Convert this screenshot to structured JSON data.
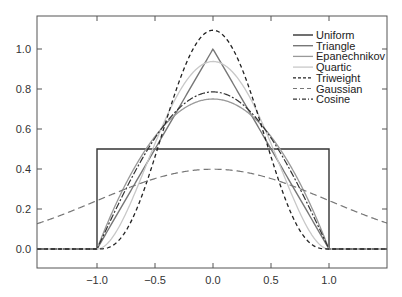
{
  "chart_data": {
    "type": "line",
    "title": "",
    "xlabel": "",
    "ylabel": "",
    "xlim": [
      -1.52,
      1.5
    ],
    "ylim": [
      -0.095,
      1.165
    ],
    "grid": false,
    "legend_position": "upper right",
    "x_ticks": [
      -1.0,
      -0.5,
      0.0,
      0.5,
      1.0
    ],
    "x_tick_labels": [
      "−1.0",
      "−0.5",
      "0.0",
      "0.5",
      "1.0"
    ],
    "y_ticks": [
      0.0,
      0.2,
      0.4,
      0.6,
      0.8,
      1.0
    ],
    "y_tick_labels": [
      "0.0",
      "0.2",
      "0.4",
      "0.6",
      "0.8",
      "1.0"
    ],
    "series": [
      {
        "name": "Uniform",
        "kernel": "uniform",
        "color": "#333333",
        "dash": "",
        "width": 1.4,
        "peak": 0.5
      },
      {
        "name": "Triangle",
        "kernel": "triangle",
        "color": "#777777",
        "dash": "",
        "width": 1.4,
        "peak": 1.0
      },
      {
        "name": "Epanechnikov",
        "kernel": "epanechnikov",
        "color": "#999999",
        "dash": "",
        "width": 1.3,
        "peak": 0.75
      },
      {
        "name": "Quartic",
        "kernel": "quartic",
        "color": "#c8c8c8",
        "dash": "",
        "width": 1.3,
        "peak": 0.9375
      },
      {
        "name": "Triweight",
        "kernel": "triweight",
        "color": "#222222",
        "dash": "4,3",
        "width": 1.3,
        "peak": 1.09375
      },
      {
        "name": "Gaussian",
        "kernel": "gaussian",
        "color": "#777777",
        "dash": "7,4",
        "width": 1.2,
        "peak": 0.3989
      },
      {
        "name": "Cosine",
        "kernel": "cosine",
        "color": "#333333",
        "dash": "7,2,2,2",
        "width": 1.2,
        "peak": 0.7854
      }
    ]
  }
}
